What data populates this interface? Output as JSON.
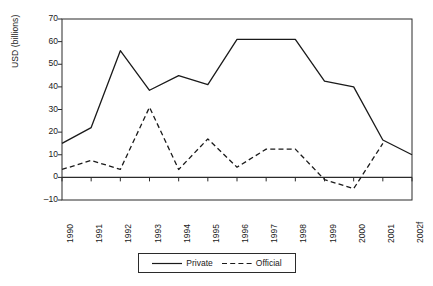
{
  "chart_data": {
    "type": "line",
    "title": "",
    "xlabel": "",
    "ylabel": "USD (billions)",
    "ylim": [
      -10,
      70
    ],
    "ytick_labels": [
      "70",
      "60",
      "50",
      "40",
      "30",
      "20",
      "10",
      "0",
      "–10"
    ],
    "ytick_values": [
      70,
      60,
      50,
      40,
      30,
      20,
      10,
      0,
      -10
    ],
    "grid": false,
    "legend_position": "bottom",
    "categories": [
      "1990",
      "1991",
      "1992",
      "1993",
      "1994",
      "1995",
      "1996",
      "1997",
      "1998",
      "1999",
      "2000",
      "2001",
      "2002f"
    ],
    "series": [
      {
        "name": "Private",
        "style": "solid",
        "color": "#1a1a1a",
        "values": [
          15,
          22,
          56,
          38.5,
          45,
          41,
          61,
          61,
          61,
          42.5,
          40,
          16.5,
          10
        ]
      },
      {
        "name": "Official",
        "style": "dashed",
        "color": "#1a1a1a",
        "values": [
          3.5,
          7.5,
          3.5,
          31,
          3.5,
          17,
          4.5,
          12.5,
          12.5,
          -1,
          -5,
          15,
          null
        ]
      }
    ]
  },
  "legend": {
    "entries": [
      {
        "label": "Private",
        "style": "solid"
      },
      {
        "label": "Official",
        "style": "dashed"
      }
    ]
  },
  "axes": {
    "y_title": "USD (billions)"
  }
}
